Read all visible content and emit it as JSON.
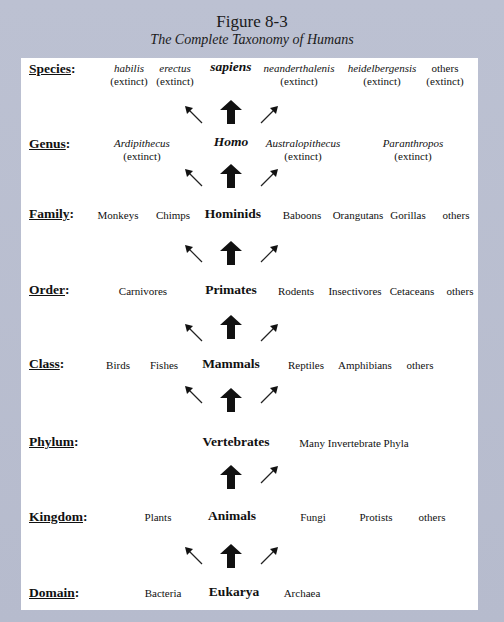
{
  "figure": {
    "title": "Figure 8-3",
    "subtitle": "The Complete Taxonomy of Humans"
  },
  "colors": {
    "frame": "#b9bed0",
    "panel": "#ffffff",
    "text": "#111111"
  },
  "ranks": [
    {
      "label": "Species",
      "colon": ":",
      "items": [
        {
          "name": "habilis",
          "sub": "(extinct)",
          "italic": true
        },
        {
          "name": "erectus",
          "sub": "(extinct)",
          "italic": true
        },
        {
          "name": "sapiens",
          "sub": "",
          "italic": true,
          "main": true
        },
        {
          "name": "neanderthalenis",
          "sub": "(extinct)",
          "italic": true
        },
        {
          "name": "heidelbergensis",
          "sub": "(extinct)",
          "italic": true
        },
        {
          "name": "others",
          "sub": "(extinct)",
          "italic": false
        }
      ]
    },
    {
      "label": "Genus",
      "colon": ":",
      "items": [
        {
          "name": "Ardipithecus",
          "sub": "(extinct)",
          "italic": true
        },
        {
          "name": "Homo",
          "sub": "",
          "italic": true,
          "main": true
        },
        {
          "name": "Australopithecus",
          "sub": "(extinct)",
          "italic": true
        },
        {
          "name": "Paranthropos",
          "sub": "(extinct)",
          "italic": true
        }
      ]
    },
    {
      "label": "Family",
      "colon": ":",
      "items": [
        {
          "name": "Monkeys"
        },
        {
          "name": "Chimps"
        },
        {
          "name": "Hominids",
          "main": true
        },
        {
          "name": "Baboons"
        },
        {
          "name": "Orangutans"
        },
        {
          "name": "Gorillas"
        },
        {
          "name": "others"
        }
      ]
    },
    {
      "label": "Order",
      "colon": ":",
      "items": [
        {
          "name": "Carnivores"
        },
        {
          "name": "Primates",
          "main": true
        },
        {
          "name": "Rodents"
        },
        {
          "name": "Insectivores"
        },
        {
          "name": "Cetaceans"
        },
        {
          "name": "others"
        }
      ]
    },
    {
      "label": "Class",
      "colon": ":",
      "items": [
        {
          "name": "Birds"
        },
        {
          "name": "Fishes"
        },
        {
          "name": "Mammals",
          "main": true
        },
        {
          "name": "Reptiles"
        },
        {
          "name": "Amphibians"
        },
        {
          "name": "others"
        }
      ]
    },
    {
      "label": "Phylum",
      "colon": ":",
      "items": [
        {
          "name": "Vertebrates",
          "main": true
        },
        {
          "name": "Many Invertebrate Phyla"
        }
      ]
    },
    {
      "label": "Kingdom",
      "colon": ":",
      "items": [
        {
          "name": "Plants"
        },
        {
          "name": "Animals",
          "main": true
        },
        {
          "name": "Fungi"
        },
        {
          "name": "Protists"
        },
        {
          "name": "others"
        }
      ]
    },
    {
      "label": "Domain",
      "colon": ":",
      "items": [
        {
          "name": "Bacteria"
        },
        {
          "name": "Eukarya",
          "main": true
        },
        {
          "name": "Archaea"
        }
      ]
    }
  ],
  "arrows": [
    {
      "between": "Genus-Species",
      "left": true,
      "up": true,
      "right": true
    },
    {
      "between": "Family-Genus",
      "left": true,
      "up": true,
      "right": true
    },
    {
      "between": "Order-Family",
      "left": true,
      "up": true,
      "right": true
    },
    {
      "between": "Class-Order",
      "left": true,
      "up": true,
      "right": true
    },
    {
      "between": "Phylum-Class",
      "left": true,
      "up": true,
      "right": true
    },
    {
      "between": "Kingdom-Phylum",
      "left": false,
      "up": true,
      "right": true
    },
    {
      "between": "Domain-Kingdom",
      "left": true,
      "up": true,
      "right": true
    }
  ]
}
